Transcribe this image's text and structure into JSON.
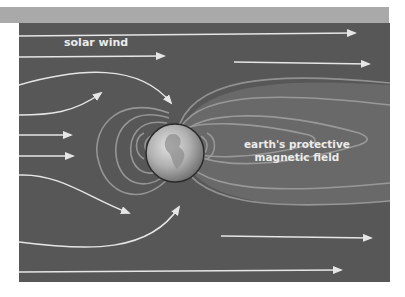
{
  "diagram": {
    "labels": {
      "solar_wind": "solar wind",
      "field_line1": "earth's protective",
      "field_line2": "magnetic field"
    },
    "colors": {
      "background": "#575757",
      "top_bar": "#a9a9a9",
      "field_lines": "#9a9a9a",
      "wind_arrows": "#e6e6e6",
      "earth": "#bdbdbd"
    },
    "elements": [
      "solar wind flow arrows",
      "earth globe",
      "magnetic field lines",
      "magnetotail"
    ]
  }
}
